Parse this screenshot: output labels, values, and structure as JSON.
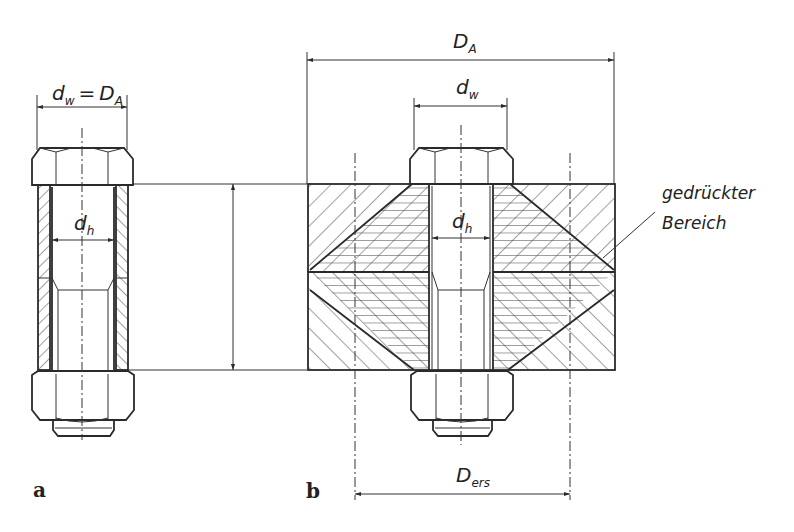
{
  "figure": {
    "panel_a": {
      "label": "a",
      "dim_top": {
        "main": "d",
        "sub": "w",
        "eq": "=",
        "main2": "D",
        "sub2": "A"
      },
      "dim_inner": {
        "main": "d",
        "sub": "h"
      }
    },
    "clamp_length": {
      "main": "l",
      "sub": "K"
    },
    "panel_b": {
      "label": "b",
      "dim_outer": {
        "main": "D",
        "sub": "A"
      },
      "dim_head": {
        "main": "d",
        "sub": "w"
      },
      "dim_inner": {
        "main": "d",
        "sub": "h"
      },
      "dim_bottom": {
        "main": "D",
        "sub": "ers"
      },
      "annotation_line1": "gedrückter",
      "annotation_line2": "Bereich"
    }
  },
  "colors": {
    "line": "#2a2a2a",
    "background": "#ffffff"
  }
}
